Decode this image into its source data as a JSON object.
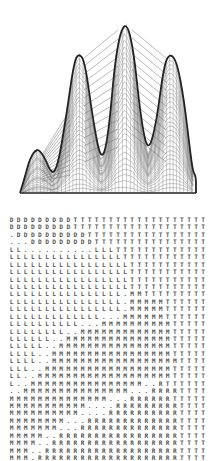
{
  "figure": {
    "top_panel": {
      "type": "3d-mesh-surface",
      "description": "Wireframe surface with four peaks of varying height",
      "peaks": [
        {
          "label": "peak-1",
          "x": 37,
          "y": 148
        },
        {
          "label": "peak-2",
          "x": 79,
          "y": 53
        },
        {
          "label": "peak-3",
          "x": 125,
          "y": 19
        },
        {
          "label": "peak-4",
          "x": 170,
          "y": 53
        }
      ],
      "valleys": [
        {
          "x": 52,
          "y": 175
        },
        {
          "x": 101,
          "y": 162
        },
        {
          "x": 148,
          "y": 153
        }
      ],
      "line_color": "#222222",
      "mesh_color": "#777777"
    },
    "bottom_panel": {
      "type": "character-grid",
      "legend_symbols": [
        "D",
        "T",
        "L",
        "M",
        "R",
        "."
      ],
      "rows": [
        "DDDDDDDDDTTTTTTTTTTTTTTTTTTT",
        "DDDDDDDDDTTTTTTTTTTTTTTTTTTT",
        ".DDDDDDDDDDTTTTTTTTTTTTTTTTT",
        "...DDDDDDDDDTTTTTTTTTTTTTTTT",
        "LL..........LLLTTTTTTTTTTTTT",
        "LLLLLLLLLLLLLLLLTTTTTTTTTTTT",
        "LLLLLLLLLLLLLLLLLTTTTTTTTTTT",
        "LLLLLLLLLLLLLLLLLTTTTTTTTTTT",
        "LLLLLLLLLLLLLLLLLTTTTTTTTTTT",
        "LLLLLLLLLLLLLLLLLTTTTTTTTTTT",
        "LLLLLLLLLLLLLLLL.MMTTTTTTTTT",
        "LLLLLLLLLLLLLLLL.MMMMMTTTTTT",
        "LLLLLLLLLLLLLLLL.MMMMMTTTTTT",
        "LLLLLLLLLLLLL...MMMMMMTTTTTT",
        "LLLLLLLLLL...MMMMMMMMMMTTTTT",
        "LLLLLLLL..MMMMMMMMMMMMMTTTTT",
        "LLLLLL..MMMMMMMMMMMMMMMTTTTT",
        "LLLLL..MMMMMMMMMMMMMMMMTTTTT",
        "LLLL..MMMMMMMMMMMMMMMMMTTTTT",
        "LLLL..MMMMMMMMMMMMMMMMMMTTTT",
        "LLL..MMMMMMMMMMMMMMMMMMTTTTT",
        "LL..MMMMMMMMMMMMMMMMMMMTTTTT",
        "L..MMMMMMMMMMMMMMMM..RTTTTTT",
        "..MMMMMMMMMMMMMMM...RRRRTTTT",
        "MMMMMMMMMMMMMM...RRRRRRTTTTT",
        "MMMMMMMMMMM....RRRRRRRRRTTTT",
        "MMMMMMMMMM....RRRRRRRRRRTTTT",
        "MMMMMMMM...RRRRRRRRRRRRRTTTT",
        "MMMMMMM...RRRRRRRRRRRRRRTTTT",
        "MMMMM..RRRRRRRRRRRRRRRRRTTTT",
        "MMMM..RRRRRRRRRRRRRRRRRRTTTT",
        "MMM..RRRRRRRRRRRRRRRRRRRTTTT",
        "MMM.RRRRRRRRRRRRRRRRRRRRTTTT"
      ]
    }
  }
}
